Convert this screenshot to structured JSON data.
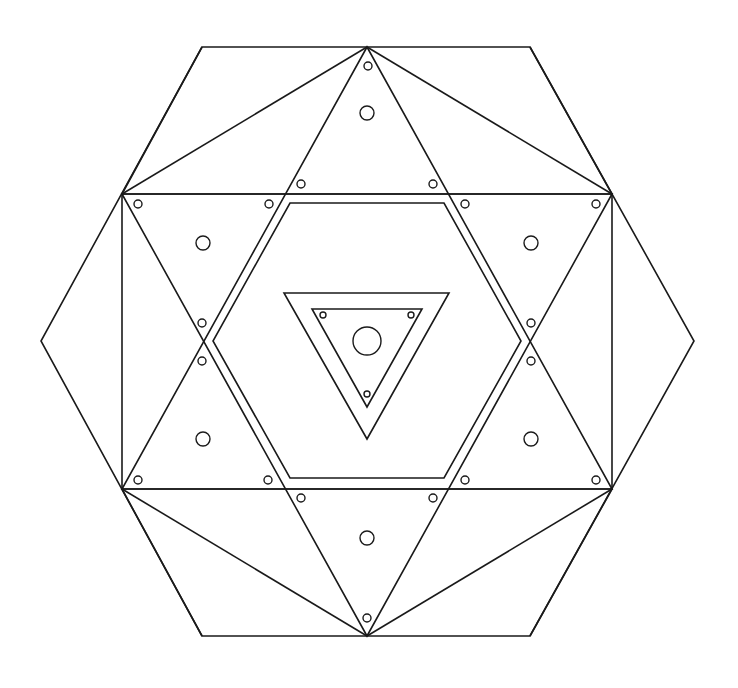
{
  "diagram": {
    "title": "",
    "stroke_color": "#1a1a1a",
    "background": "#ffffff",
    "center": [
      367,
      341
    ],
    "outer_hexagon": [
      [
        202,
        47
      ],
      [
        530,
        47
      ],
      [
        694,
        341
      ],
      [
        530,
        636
      ],
      [
        202,
        636
      ],
      [
        41,
        341
      ]
    ],
    "up_triangle": [
      [
        367,
        47
      ],
      [
        122,
        489
      ],
      [
        612,
        489
      ]
    ],
    "down_triangle": [
      [
        122,
        194
      ],
      [
        612,
        194
      ],
      [
        367,
        636
      ]
    ],
    "rectangle": [
      [
        122,
        194
      ],
      [
        612,
        194
      ],
      [
        612,
        489
      ],
      [
        122,
        489
      ]
    ],
    "connector_lines": [
      [
        [
          367,
          47
        ],
        [
          122,
          194
        ]
      ],
      [
        [
          367,
          47
        ],
        [
          612,
          194
        ]
      ],
      [
        [
          367,
          636
        ],
        [
          122,
          489
        ]
      ],
      [
        [
          367,
          636
        ],
        [
          612,
          489
        ]
      ],
      [
        [
          202,
          47
        ],
        [
          122,
          194
        ]
      ],
      [
        [
          530,
          47
        ],
        [
          612,
          194
        ]
      ],
      [
        [
          202,
          636
        ],
        [
          122,
          489
        ]
      ],
      [
        [
          530,
          636
        ],
        [
          612,
          489
        ]
      ]
    ],
    "inner_hexagon": [
      [
        290,
        203
      ],
      [
        444,
        203
      ],
      [
        521,
        341
      ],
      [
        444,
        478
      ],
      [
        290,
        478
      ],
      [
        213,
        341
      ]
    ],
    "center_triangle_outer": [
      [
        284,
        293
      ],
      [
        449,
        293
      ],
      [
        367,
        439
      ]
    ],
    "center_triangle_inner": [
      [
        312,
        309
      ],
      [
        422,
        309
      ],
      [
        367,
        407
      ]
    ],
    "large_circles": [
      {
        "cx": 367,
        "cy": 113,
        "r": 7
      },
      {
        "cx": 203,
        "cy": 243,
        "r": 7
      },
      {
        "cx": 531,
        "cy": 243,
        "r": 7
      },
      {
        "cx": 203,
        "cy": 439,
        "r": 7
      },
      {
        "cx": 531,
        "cy": 439,
        "r": 7
      },
      {
        "cx": 367,
        "cy": 538,
        "r": 7
      },
      {
        "cx": 367,
        "cy": 341,
        "r": 14
      }
    ],
    "small_circles": [
      {
        "cx": 368,
        "cy": 66,
        "r": 4
      },
      {
        "cx": 301,
        "cy": 184,
        "r": 4
      },
      {
        "cx": 433,
        "cy": 184,
        "r": 4
      },
      {
        "cx": 138,
        "cy": 204,
        "r": 4
      },
      {
        "cx": 269,
        "cy": 204,
        "r": 4
      },
      {
        "cx": 465,
        "cy": 204,
        "r": 4
      },
      {
        "cx": 596,
        "cy": 204,
        "r": 4
      },
      {
        "cx": 202,
        "cy": 323,
        "r": 4
      },
      {
        "cx": 531,
        "cy": 323,
        "r": 4
      },
      {
        "cx": 202,
        "cy": 361,
        "r": 4
      },
      {
        "cx": 531,
        "cy": 361,
        "r": 4
      },
      {
        "cx": 138,
        "cy": 480,
        "r": 4
      },
      {
        "cx": 268,
        "cy": 480,
        "r": 4
      },
      {
        "cx": 465,
        "cy": 480,
        "r": 4
      },
      {
        "cx": 596,
        "cy": 480,
        "r": 4
      },
      {
        "cx": 301,
        "cy": 498,
        "r": 4
      },
      {
        "cx": 433,
        "cy": 498,
        "r": 4
      },
      {
        "cx": 367,
        "cy": 618,
        "r": 4
      },
      {
        "cx": 323,
        "cy": 315,
        "r": 3
      },
      {
        "cx": 411,
        "cy": 315,
        "r": 3
      },
      {
        "cx": 367,
        "cy": 394,
        "r": 3
      }
    ]
  }
}
